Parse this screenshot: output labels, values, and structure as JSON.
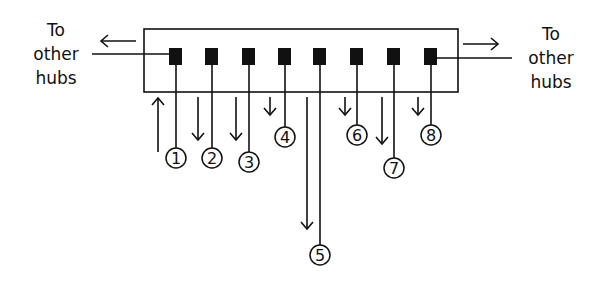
{
  "diagram": {
    "type": "network-hub-ports",
    "left_label": [
      "To",
      "other",
      "hubs"
    ],
    "right_label": [
      "To",
      "other",
      "hubs"
    ],
    "hub": {
      "x": 144,
      "y": 29,
      "width": 314,
      "height": 63
    },
    "ports": [
      {
        "id": "1",
        "x": 176,
        "circle_y": 158,
        "arrow": {
          "dir": "up",
          "x": 158,
          "y1": 98,
          "y2": 152
        }
      },
      {
        "id": "2",
        "x": 212,
        "circle_y": 158,
        "arrow": {
          "dir": "down",
          "x": 198,
          "y1": 97,
          "y2": 140
        }
      },
      {
        "id": "3",
        "x": 249,
        "circle_y": 162,
        "arrow": {
          "dir": "down",
          "x": 236,
          "y1": 97,
          "y2": 140
        }
      },
      {
        "id": "4",
        "x": 285,
        "circle_y": 137,
        "arrow": {
          "dir": "down",
          "x": 270,
          "y1": 97,
          "y2": 115
        }
      },
      {
        "id": "5",
        "x": 320,
        "circle_y": 255,
        "arrow": {
          "dir": "down",
          "x": 307,
          "y1": 97,
          "y2": 229
        }
      },
      {
        "id": "6",
        "x": 357,
        "circle_y": 135,
        "arrow": {
          "dir": "down",
          "x": 345,
          "y1": 97,
          "y2": 115
        }
      },
      {
        "id": "7",
        "x": 394,
        "circle_y": 168,
        "arrow": {
          "dir": "down",
          "x": 382,
          "y1": 97,
          "y2": 144
        }
      },
      {
        "id": "8",
        "x": 431,
        "circle_y": 135,
        "arrow": {
          "dir": "down",
          "x": 418,
          "y1": 97,
          "y2": 115
        }
      }
    ],
    "uplinks": [
      {
        "side": "left",
        "direction": "outbound-left"
      },
      {
        "side": "right",
        "direction": "outbound-right"
      }
    ]
  },
  "colors": {
    "line": "#111111",
    "background": "#ffffff"
  }
}
